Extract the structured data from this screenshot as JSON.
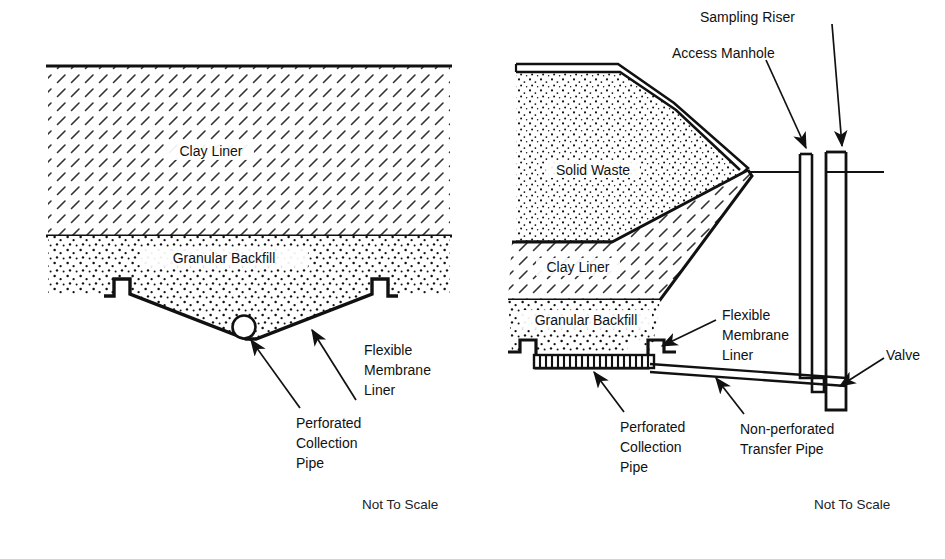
{
  "figure": {
    "colors": {
      "ink": "#111111",
      "paper": "#ffffff",
      "hatch": "#222222",
      "stipple": "#000000"
    }
  },
  "left_panel": {
    "name": "trench cross-section",
    "layers": [
      {
        "id": "clay",
        "label": "Clay Liner",
        "fill": "diagonal-hatch"
      },
      {
        "id": "granular",
        "label": "Granular Backfill",
        "fill": "stipple"
      }
    ],
    "callouts": [
      {
        "id": "fml",
        "lines": [
          "Flexible",
          "Membrane",
          "Liner"
        ]
      },
      {
        "id": "pipe",
        "lines": [
          "Perforated",
          "Collection",
          "Pipe"
        ]
      }
    ],
    "footnote": "Not To Scale"
  },
  "right_panel": {
    "name": "landfill edge with sampling riser",
    "layers": [
      {
        "id": "waste",
        "label": "Solid Waste",
        "fill": "stipple"
      },
      {
        "id": "clay",
        "label": "Clay Liner",
        "fill": "diagonal-hatch"
      },
      {
        "id": "granular",
        "label": "Granular Backfill",
        "fill": "stipple"
      }
    ],
    "callouts": [
      {
        "id": "sampling-riser",
        "lines": [
          "Sampling Riser"
        ]
      },
      {
        "id": "access-manhole",
        "lines": [
          "Access Manhole"
        ]
      },
      {
        "id": "fml",
        "lines": [
          "Flexible",
          "Membrane",
          "Liner"
        ]
      },
      {
        "id": "valve",
        "lines": [
          "Valve"
        ]
      },
      {
        "id": "perforated-pipe",
        "lines": [
          "Perforated",
          "Collection",
          "Pipe"
        ]
      },
      {
        "id": "transfer-pipe",
        "lines": [
          "Non-perforated",
          "Transfer Pipe"
        ]
      }
    ],
    "footnote": "Not To Scale"
  }
}
